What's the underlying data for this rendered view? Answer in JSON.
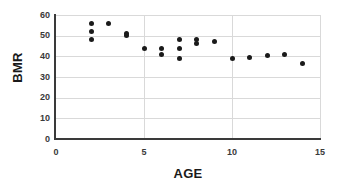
{
  "chart_data": {
    "type": "scatter",
    "title": "",
    "xlabel": "AGE",
    "ylabel": "BMR",
    "xlim": [
      0,
      15
    ],
    "ylim": [
      0,
      60
    ],
    "xticks": [
      0,
      5,
      10,
      15
    ],
    "yticks": [
      0,
      10,
      20,
      30,
      40,
      50,
      60
    ],
    "grid": "horizontal-and-vertical-light-gray",
    "legend": "none",
    "marker_color": "#1a1a1a",
    "axis_color": "#3a3a3a",
    "gridline_color": "#d9d9d9",
    "points": [
      {
        "x": 2,
        "y": 56.0
      },
      {
        "x": 2,
        "y": 52.0
      },
      {
        "x": 2,
        "y": 48.0
      },
      {
        "x": 3,
        "y": 56.0
      },
      {
        "x": 4,
        "y": 51.0
      },
      {
        "x": 4,
        "y": 50.0
      },
      {
        "x": 5,
        "y": 44.0
      },
      {
        "x": 6,
        "y": 44.0
      },
      {
        "x": 6,
        "y": 41.0
      },
      {
        "x": 7,
        "y": 48.0
      },
      {
        "x": 7,
        "y": 44.0
      },
      {
        "x": 7,
        "y": 39.0
      },
      {
        "x": 8,
        "y": 48.0
      },
      {
        "x": 8,
        "y": 46.0
      },
      {
        "x": 9,
        "y": 47.0
      },
      {
        "x": 10,
        "y": 39.0
      },
      {
        "x": 11,
        "y": 39.3
      },
      {
        "x": 12,
        "y": 40.2
      },
      {
        "x": 13,
        "y": 41.0
      },
      {
        "x": 14,
        "y": 36.5
      }
    ]
  }
}
